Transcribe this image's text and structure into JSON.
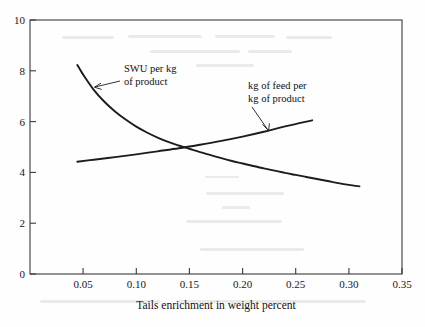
{
  "chart_data": {
    "type": "line",
    "title": "",
    "subtitle": "",
    "xlabel": "Tails enrichment in weight percent",
    "ylabel": "",
    "xlim": [
      0,
      0.35
    ],
    "ylim": [
      0,
      10
    ],
    "xticks": [
      0.05,
      0.1,
      0.15,
      0.2,
      0.25,
      0.3,
      0.35
    ],
    "xtick_labels": [
      "0.05",
      "0.10",
      "0.15",
      "0.20",
      "0.25",
      "0.30",
      "0.35"
    ],
    "yticks": [
      0,
      2,
      4,
      6,
      8,
      10
    ],
    "ytick_labels": [
      "0",
      "2",
      "4",
      "6",
      "8",
      "10"
    ],
    "grid": false,
    "legend_position": "inline-annotations",
    "series": [
      {
        "name": "SWU per kg of product",
        "label_line1": "SWU per kg",
        "label_line2": "of product",
        "x": [
          0.0445,
          0.05,
          0.06,
          0.07,
          0.08,
          0.09,
          0.1,
          0.11,
          0.12,
          0.13,
          0.14,
          0.15,
          0.16,
          0.17,
          0.18,
          0.19,
          0.2,
          0.21,
          0.22,
          0.23,
          0.24,
          0.25,
          0.26,
          0.27,
          0.28,
          0.29,
          0.3,
          0.31
        ],
        "values": [
          8.23,
          7.85,
          7.25,
          6.78,
          6.4,
          6.08,
          5.8,
          5.57,
          5.37,
          5.2,
          5.06,
          4.93,
          4.8,
          4.68,
          4.56,
          4.45,
          4.35,
          4.25,
          4.16,
          4.07,
          3.98,
          3.9,
          3.82,
          3.74,
          3.66,
          3.58,
          3.51,
          3.45
        ]
      },
      {
        "name": "kg of feed per kg of product",
        "label_line1": "kg of feed per",
        "label_line2": "kg of product",
        "x": [
          0.0445,
          0.06,
          0.08,
          0.1,
          0.12,
          0.14,
          0.16,
          0.18,
          0.2,
          0.22,
          0.24,
          0.2655
        ],
        "values": [
          4.42,
          4.5,
          4.6,
          4.71,
          4.83,
          4.95,
          5.09,
          5.24,
          5.41,
          5.6,
          5.81,
          6.05
        ]
      }
    ],
    "annotations": [
      {
        "name": "swu-annotation",
        "text_line1": "SWU per kg",
        "text_line2": "of product",
        "points_to_x": 0.056,
        "points_to_y": 7.35
      },
      {
        "name": "feed-annotation",
        "text_line1": "kg of feed per",
        "text_line2": "kg of product",
        "points_to_x": 0.222,
        "points_to_y": 5.62
      }
    ],
    "crossing_point": {
      "x": 0.148,
      "y": 5.0
    },
    "colors": {
      "curve": "#1c1c1c",
      "axis": "#3a3a3a",
      "text": "#111111",
      "background": "#fefefe"
    }
  }
}
